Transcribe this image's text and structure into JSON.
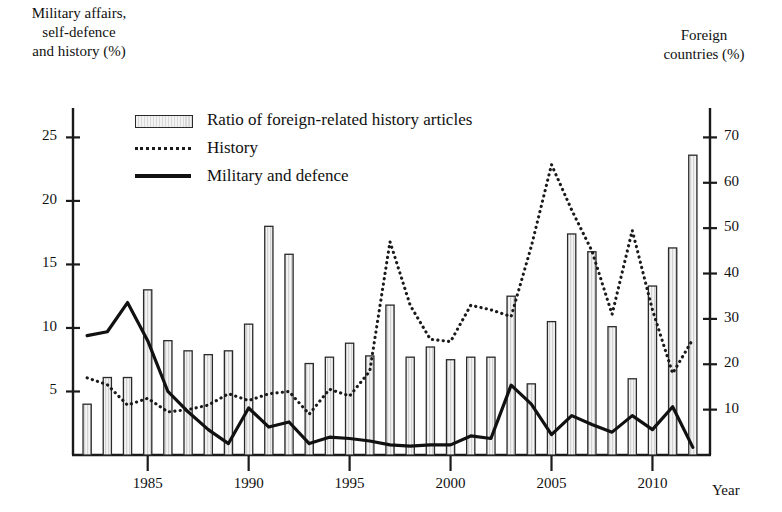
{
  "axes": {
    "left_title": "Military affairs,\nself-defence\nand history (%)",
    "right_title": "Foreign\ncountries (%)",
    "x_title": "Year",
    "left_ticks": [
      5,
      10,
      15,
      20,
      25
    ],
    "right_ticks": [
      10,
      20,
      30,
      40,
      50,
      60,
      70
    ],
    "x_ticks": [
      1985,
      1990,
      1995,
      2000,
      2005,
      2010
    ]
  },
  "legend": {
    "items": [
      {
        "key": "bar",
        "label": "Ratio of foreign-related history articles"
      },
      {
        "key": "dotted",
        "label": "History"
      },
      {
        "key": "solid",
        "label": "Military and defence"
      }
    ]
  },
  "colors": {
    "bar_stroke": "#2a2a2a",
    "bar_fill": "#e6e6e6",
    "history_line": "#1a1a1a",
    "military_line": "#111111",
    "axis": "#1a1a1a"
  },
  "chart_data": {
    "type": "bar",
    "title": "",
    "xlabel": "Year",
    "ylabel": "Military affairs, self-defence and history (%)",
    "y2label": "Foreign countries (%)",
    "xlim": [
      1981.2,
      1912.8
    ],
    "ylim": [
      0,
      27
    ],
    "y2lim": [
      0,
      75.6
    ],
    "grid": false,
    "legend_position": "top-left",
    "categories": [
      1982,
      1983,
      1984,
      1985,
      1986,
      1987,
      1988,
      1989,
      1990,
      1991,
      1992,
      1993,
      1994,
      1995,
      1996,
      1997,
      1998,
      1999,
      2000,
      2001,
      2002,
      2003,
      2004,
      2005,
      2006,
      2007,
      2008,
      2009,
      2010,
      2011,
      2012
    ],
    "series": [
      {
        "name": "Ratio of foreign-related history articles",
        "type": "bar",
        "axis": "left",
        "unit": "%",
        "values": [
          4.0,
          6.1,
          6.1,
          13.0,
          9.0,
          8.2,
          7.9,
          8.2,
          10.3,
          18.0,
          15.8,
          7.2,
          7.7,
          8.8,
          7.8,
          11.8,
          7.7,
          8.5,
          7.5,
          7.7,
          7.7,
          12.5,
          5.6,
          10.5,
          17.4,
          16.0,
          10.1,
          6.0,
          13.3,
          16.3,
          23.6
        ]
      },
      {
        "name": "History",
        "type": "line",
        "style": "dotted",
        "axis": "right",
        "unit": "%",
        "values": [
          17.0,
          15.5,
          11.0,
          12.5,
          9.5,
          10.0,
          11.0,
          13.5,
          12.0,
          13.5,
          14.0,
          9.0,
          14.5,
          13.0,
          18.5,
          47.0,
          33.0,
          25.5,
          25.0,
          33.0,
          32.0,
          30.5,
          46.0,
          64.0,
          54.0,
          45.0,
          31.0,
          49.5,
          32.0,
          18.0,
          25.5
        ]
      },
      {
        "name": "Military and defence",
        "type": "line",
        "style": "solid",
        "axis": "left",
        "unit": "%",
        "values": [
          9.4,
          9.7,
          12.0,
          9.0,
          5.0,
          3.4,
          2.0,
          0.9,
          3.7,
          2.2,
          2.6,
          0.9,
          1.4,
          1.3,
          1.1,
          0.8,
          0.7,
          0.8,
          0.8,
          1.5,
          1.3,
          5.5,
          4.0,
          1.6,
          3.1,
          2.4,
          1.8,
          3.1,
          2.0,
          3.8,
          0.6
        ]
      }
    ]
  }
}
